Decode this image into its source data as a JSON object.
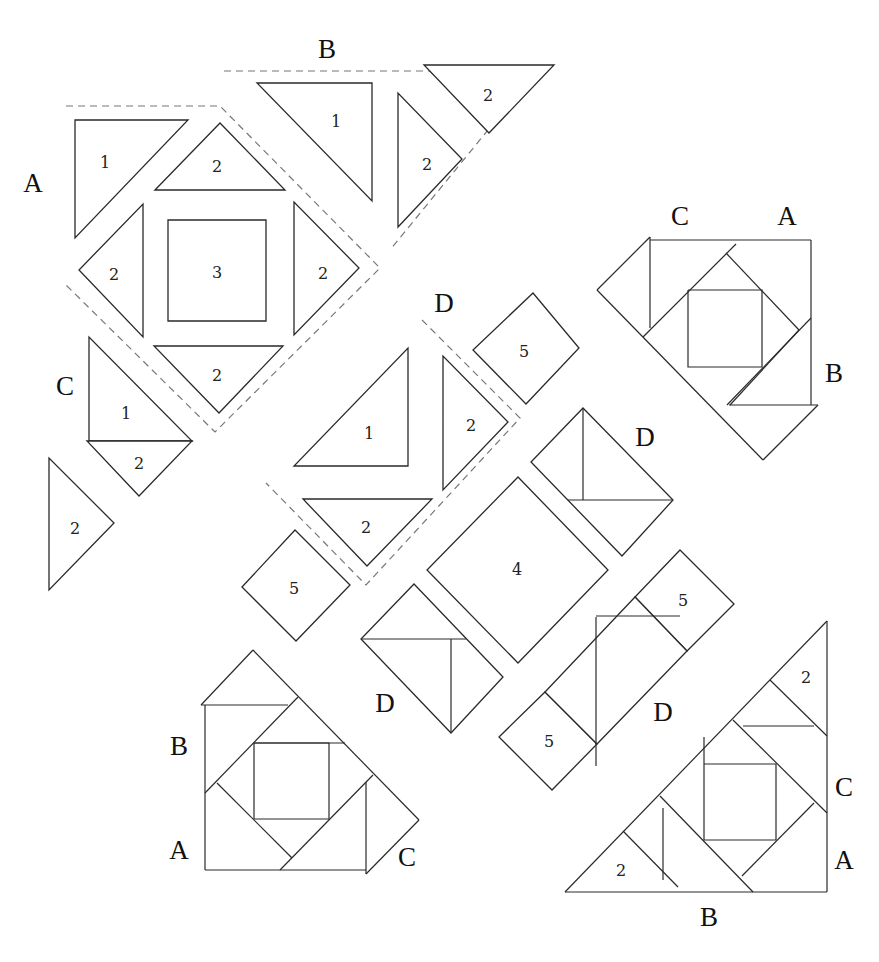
{
  "diagram": {
    "background": "#ffffff",
    "line_color": "#2a2a2a",
    "guide_color": "#777777"
  },
  "unit_groups": [
    {
      "id": "unit-A",
      "label": "A",
      "label_pos": [
        33,
        183
      ],
      "guide": [
        [
          66,
          106
        ],
        [
          220,
          106
        ],
        [
          380,
          268
        ],
        [
          215,
          432
        ],
        [
          66,
          285
        ]
      ],
      "pieces": [
        {
          "type": "triangle",
          "num": "1",
          "pts": [
            [
              75,
              120
            ],
            [
              188,
              120
            ],
            [
              75,
              238
            ]
          ],
          "num_pos": [
            105,
            162
          ]
        },
        {
          "type": "triangle",
          "num": "2",
          "pts": [
            [
              155,
              190
            ],
            [
              220,
              123
            ],
            [
              285,
              190
            ]
          ],
          "num_pos": [
            217,
            166
          ]
        },
        {
          "type": "triangle",
          "num": "2",
          "pts": [
            [
              143,
              204
            ],
            [
              143,
              337
            ],
            [
              79,
              270
            ]
          ],
          "num_pos": [
            114,
            274
          ]
        },
        {
          "type": "square",
          "num": "3",
          "pts": [
            [
              168,
              220
            ],
            [
              266,
              220
            ],
            [
              266,
              321
            ],
            [
              168,
              321
            ]
          ],
          "num_pos": [
            217,
            272
          ]
        },
        {
          "type": "triangle",
          "num": "2",
          "pts": [
            [
              294,
              202
            ],
            [
              294,
              335
            ],
            [
              359,
              268
            ]
          ],
          "num_pos": [
            323,
            273
          ]
        },
        {
          "type": "triangle",
          "num": "2",
          "pts": [
            [
              154,
              346
            ],
            [
              283,
              346
            ],
            [
              219,
              413
            ]
          ],
          "num_pos": [
            217,
            375
          ]
        }
      ]
    },
    {
      "id": "unit-B",
      "label": "B",
      "label_pos": [
        327,
        49
      ],
      "guide": [
        [
          224,
          71
        ],
        [
          430,
          71
        ],
        [
          488,
          130
        ],
        [
          390,
          250
        ]
      ],
      "pieces": [
        {
          "type": "triangle",
          "num": "1",
          "pts": [
            [
              257,
              83
            ],
            [
              372,
              83
            ],
            [
              372,
              201
            ]
          ],
          "num_pos": [
            336,
            121
          ]
        },
        {
          "type": "triangle",
          "num": "2",
          "pts": [
            [
              398,
              93
            ],
            [
              398,
              227
            ],
            [
              462,
              159
            ]
          ],
          "num_pos": [
            427,
            164
          ]
        },
        {
          "type": "triangle",
          "num": "2",
          "pts": [
            [
              424,
              65
            ],
            [
              554,
              65
            ],
            [
              489,
              133
            ]
          ],
          "num_pos": [
            488,
            95
          ]
        }
      ]
    },
    {
      "id": "unit-C",
      "label": "C",
      "label_pos": [
        65,
        386
      ],
      "guide": [],
      "pieces": [
        {
          "type": "triangle",
          "num": "1",
          "pts": [
            [
              89,
              337
            ],
            [
              89,
              441
            ],
            [
              192,
              441
            ]
          ],
          "num_pos": [
            126,
            413
          ]
        },
        {
          "type": "triangle",
          "num": "2",
          "pts": [
            [
              87,
              441
            ],
            [
              192,
              441
            ],
            [
              139,
              496
            ]
          ],
          "num_pos": [
            139,
            463
          ]
        },
        {
          "type": "triangle",
          "num": "2",
          "pts": [
            [
              49,
              458
            ],
            [
              49,
              590
            ],
            [
              114,
              523
            ]
          ],
          "num_pos": [
            75,
            528
          ]
        }
      ]
    },
    {
      "id": "unit-D-top",
      "label": "D",
      "label_pos": [
        444,
        303
      ],
      "guide": [
        [
          422,
          320
        ],
        [
          520,
          418
        ],
        [
          366,
          585
        ],
        [
          266,
          483
        ]
      ],
      "pieces": [
        {
          "type": "triangle",
          "num": "1",
          "pts": [
            [
              408,
              348
            ],
            [
              408,
              466
            ],
            [
              294,
              466
            ]
          ],
          "num_pos": [
            369,
            433
          ]
        },
        {
          "type": "triangle",
          "num": "2",
          "pts": [
            [
              443,
              356
            ],
            [
              443,
              490
            ],
            [
              508,
              422
            ]
          ],
          "num_pos": [
            471,
            425
          ]
        },
        {
          "type": "triangle",
          "num": "2",
          "pts": [
            [
              303,
              499
            ],
            [
              432,
              499
            ],
            [
              367,
              566
            ]
          ],
          "num_pos": [
            366,
            527
          ]
        }
      ]
    }
  ],
  "loose_pieces": [
    {
      "type": "square",
      "num": "5",
      "pts": [
        [
          533,
          293
        ],
        [
          579,
          348
        ],
        [
          526,
          404
        ],
        [
          473,
          350
        ]
      ],
      "num_pos": [
        524,
        351
      ]
    },
    {
      "type": "square",
      "num": "5",
      "pts": [
        [
          295,
          530
        ],
        [
          350,
          585
        ],
        [
          296,
          641
        ],
        [
          242,
          587
        ]
      ],
      "num_pos": [
        294,
        588
      ]
    },
    {
      "type": "square",
      "num": "4",
      "pts": [
        [
          518,
          477
        ],
        [
          608,
          570
        ],
        [
          518,
          663
        ],
        [
          427,
          570
        ]
      ],
      "num_pos": [
        517,
        569
      ]
    }
  ],
  "d_units": [
    {
      "label": "D",
      "label_pos": [
        645,
        437
      ],
      "outline": [
        [
          583,
          408
        ],
        [
          673,
          500
        ],
        [
          622,
          556
        ],
        [
          531,
          462
        ]
      ],
      "seams": [
        [
          [
            583,
            408
          ],
          [
            583,
            500
          ]
        ],
        [
          [
            568,
            500
          ],
          [
            673,
            500
          ]
        ]
      ]
    },
    {
      "label": "D",
      "label_pos": [
        385,
        703
      ],
      "outline": [
        [
          414,
          584
        ],
        [
          503,
          677
        ],
        [
          451,
          733
        ],
        [
          361,
          639
        ]
      ],
      "seams": [
        [
          [
            361,
            639
          ],
          [
            466,
            639
          ]
        ],
        [
          [
            451,
            639
          ],
          [
            451,
            733
          ]
        ]
      ]
    },
    {
      "label": "D",
      "label_pos": [
        663,
        712
      ],
      "outline": [
        [
          680,
          550
        ],
        [
          734,
          604
        ],
        [
          591,
          766
        ],
        [
          499,
          735
        ],
        [
          554,
          693
        ]
      ],
      "seams": [
        [
          [
            596,
            617
          ],
          [
            596,
            766
          ]
        ],
        [
          [
            596,
            616
          ],
          [
            680,
            616
          ]
        ]
      ],
      "squares": [
        {
          "num": "5",
          "pts": [
            [
              680,
              550
            ],
            [
              734,
              604
            ],
            [
              687,
              651
            ],
            [
              635,
              597
            ]
          ],
          "num_pos": [
            683,
            600
          ]
        },
        {
          "num": "5",
          "pts": [
            [
              545,
              692
            ],
            [
              597,
              744
            ],
            [
              552,
              790
            ],
            [
              499,
              737
            ]
          ],
          "num_pos": [
            549,
            741
          ]
        }
      ]
    }
  ],
  "finished_blocks": [
    {
      "id": "block-top-right",
      "labels": [
        {
          "text": "C",
          "pos": [
            680,
            216
          ]
        },
        {
          "text": "A",
          "pos": [
            787,
            216
          ]
        },
        {
          "text": "B",
          "pos": [
            834,
            373
          ]
        }
      ],
      "outer": [
        [
          650,
          240
        ],
        [
          811,
          240
        ],
        [
          811,
          405
        ],
        [
          722,
          405
        ]
      ],
      "lines": [
        [
          [
            650,
            237
          ],
          [
            650,
            328
          ]
        ],
        [
          [
            650,
            240
          ],
          [
            811,
            240
          ]
        ],
        [
          [
            811,
            240
          ],
          [
            811,
            405
          ]
        ],
        [
          [
            597,
            290
          ],
          [
            650,
            237
          ]
        ],
        [
          [
            597,
            290
          ],
          [
            763,
            460
          ]
        ],
        [
          [
            729,
            405
          ],
          [
            818,
            405
          ]
        ],
        [
          [
            818,
            405
          ],
          [
            763,
            460
          ]
        ],
        [
          [
            643,
            337
          ],
          [
            736,
            244
          ]
        ],
        [
          [
            726,
            253
          ],
          [
            799,
            330
          ]
        ],
        [
          [
            799,
            330
          ],
          [
            730,
            405
          ]
        ],
        [
          [
            811,
            318
          ],
          [
            727,
            405
          ]
        ],
        [
          [
            688,
            290
          ],
          [
            762,
            290
          ],
          [
            762,
            367
          ],
          [
            688,
            367
          ],
          [
            688,
            290
          ]
        ]
      ]
    },
    {
      "id": "block-bottom-left",
      "labels": [
        {
          "text": "B",
          "pos": [
            179,
            746
          ]
        },
        {
          "text": "A",
          "pos": [
            179,
            850
          ]
        },
        {
          "text": "C",
          "pos": [
            407,
            857
          ]
        }
      ],
      "lines": [
        [
          [
            205,
            705
          ],
          [
            205,
            870
          ]
        ],
        [
          [
            205,
            870
          ],
          [
            366,
            870
          ]
        ],
        [
          [
            201,
            705
          ],
          [
            288,
            705
          ]
        ],
        [
          [
            201,
            705
          ],
          [
            253,
            650
          ]
        ],
        [
          [
            253,
            650
          ],
          [
            419,
            820
          ]
        ],
        [
          [
            419,
            820
          ],
          [
            366,
            874
          ]
        ],
        [
          [
            366,
            782
          ],
          [
            366,
            874
          ]
        ],
        [
          [
            205,
            793
          ],
          [
            298,
            697
          ]
        ],
        [
          [
            217,
            783
          ],
          [
            292,
            858
          ]
        ],
        [
          [
            280,
            870
          ],
          [
            373,
            775
          ]
        ],
        [
          [
            254,
            743
          ],
          [
            329,
            743
          ],
          [
            329,
            819
          ],
          [
            254,
            819
          ],
          [
            254,
            743
          ]
        ],
        [
          [
            254,
            743
          ],
          [
            345,
            743
          ]
        ]
      ]
    },
    {
      "id": "block-bottom-right",
      "labels": [
        {
          "text": "C",
          "pos": [
            844,
            787
          ]
        },
        {
          "text": "A",
          "pos": [
            844,
            860
          ]
        },
        {
          "text": "B",
          "pos": [
            709,
            917
          ]
        }
      ],
      "pieces_num": [
        {
          "num": "2",
          "pos": [
            806,
            677
          ]
        },
        {
          "num": "2",
          "pos": [
            621,
            870
          ]
        }
      ],
      "lines": [
        [
          [
            565,
            892
          ],
          [
            827,
            621
          ]
        ],
        [
          [
            827,
            621
          ],
          [
            827,
            892
          ]
        ],
        [
          [
            565,
            892
          ],
          [
            827,
            892
          ]
        ],
        [
          [
            770,
            680
          ],
          [
            827,
            736
          ]
        ],
        [
          [
            743,
            726
          ],
          [
            814,
            726
          ]
        ],
        [
          [
            733,
            720
          ],
          [
            827,
            813
          ]
        ],
        [
          [
            623,
            831
          ],
          [
            678,
            887
          ]
        ],
        [
          [
            660,
            796
          ],
          [
            753,
            892
          ]
        ],
        [
          [
            663,
            808
          ],
          [
            663,
            880
          ]
        ],
        [
          [
            704,
            764
          ],
          [
            776,
            764
          ],
          [
            776,
            840
          ],
          [
            704,
            840
          ],
          [
            704,
            764
          ]
        ],
        [
          [
            704,
            737
          ],
          [
            704,
            764
          ]
        ],
        [
          [
            814,
            803
          ],
          [
            742,
            876
          ]
        ]
      ]
    }
  ]
}
